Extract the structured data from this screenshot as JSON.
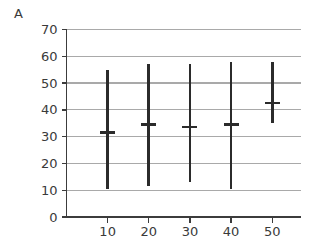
{
  "panel": {
    "label": "A"
  },
  "chart_data": {
    "type": "line",
    "subtype": "range-bars-with-mean",
    "title": "",
    "subtitle": "",
    "xlabel": "",
    "ylabel": "",
    "xlim": [
      0,
      57
    ],
    "ylim": [
      0,
      70
    ],
    "xticks": [
      10,
      20,
      30,
      40,
      50
    ],
    "yticks": [
      0,
      10,
      20,
      30,
      40,
      50,
      60,
      70
    ],
    "xtick_labels": [
      "10",
      "20",
      "30",
      "40",
      "50"
    ],
    "ytick_labels": [
      "0",
      "10",
      "20",
      "30",
      "40",
      "50",
      "60",
      "70"
    ],
    "grid": "horizontal",
    "legend": "none",
    "annotations": [],
    "x": [
      10,
      20,
      30,
      40,
      50
    ],
    "series": [
      {
        "name": "mean",
        "values": [
          31.5,
          34.5,
          33.5,
          34.5,
          42.5
        ]
      },
      {
        "name": "upper",
        "values": [
          55.0,
          57.0,
          57.0,
          58.0,
          58.0
        ]
      },
      {
        "name": "lower",
        "values": [
          10.5,
          11.5,
          13.0,
          10.5,
          35.0
        ]
      }
    ],
    "points": [
      {
        "x": 10,
        "mean": 31.5,
        "low": 10.5,
        "high": 55.0
      },
      {
        "x": 20,
        "mean": 34.5,
        "low": 11.5,
        "high": 57.0
      },
      {
        "x": 30,
        "mean": 33.5,
        "low": 13.0,
        "high": 57.0
      },
      {
        "x": 40,
        "mean": 34.5,
        "low": 10.5,
        "high": 58.0
      },
      {
        "x": 50,
        "mean": 42.5,
        "low": 35.0,
        "high": 58.0
      }
    ],
    "colors": {
      "bar": "#2b2b2b",
      "grid": "#a9a9a9",
      "axis": "#3c3c3c",
      "text": "#3a3a3a",
      "background": "#ffffff"
    }
  }
}
